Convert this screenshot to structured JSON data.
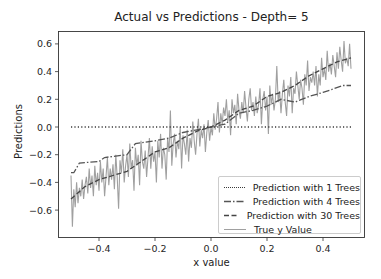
{
  "chart_data": {
    "type": "line",
    "title": "Actual vs Predictions - Depth= 5",
    "xlabel": "x value",
    "ylabel": "Predictions",
    "xlim": [
      -0.55,
      0.55
    ],
    "ylim": [
      -0.78,
      0.68
    ],
    "x_ticks": [
      -0.4,
      -0.2,
      0.0,
      0.2,
      0.4
    ],
    "x_tick_labels": [
      "−0.4",
      "−0.2",
      "0.0",
      "0.2",
      "0.4"
    ],
    "y_ticks": [
      0.6,
      0.4,
      0.2,
      0.0,
      -0.2,
      -0.4,
      -0.6
    ],
    "y_tick_labels": [
      "0.6",
      "0.4",
      "0.2",
      "0.0",
      "−0.2",
      "−0.4",
      "−0.6"
    ],
    "grid": false,
    "legend_position": "lower right",
    "series": [
      {
        "name": "Prediction with 1 Trees",
        "style": "dotted",
        "color": "#3a3a3a",
        "x": [
          -0.5,
          0.5
        ],
        "values": [
          0.0,
          0.0
        ]
      },
      {
        "name": "Prediction with 4 Trees",
        "style": "dashdot",
        "color": "#555555",
        "x": [
          -0.5,
          -0.49,
          -0.47,
          -0.4,
          -0.38,
          -0.3,
          -0.27,
          -0.2,
          -0.15,
          -0.1,
          -0.05,
          0.0,
          0.05,
          0.1,
          0.15,
          0.2,
          0.25,
          0.3,
          0.35,
          0.4,
          0.43,
          0.47,
          0.5
        ],
        "values": [
          -0.33,
          -0.33,
          -0.26,
          -0.25,
          -0.22,
          -0.2,
          -0.12,
          -0.1,
          -0.08,
          -0.04,
          -0.02,
          0.0,
          0.02,
          0.1,
          0.12,
          0.15,
          0.2,
          0.18,
          0.22,
          0.25,
          0.27,
          0.3,
          0.3
        ]
      },
      {
        "name": "Prediction with 30 Trees",
        "style": "dashed",
        "color": "#444444",
        "x": [
          -0.5,
          -0.45,
          -0.4,
          -0.35,
          -0.3,
          -0.25,
          -0.2,
          -0.15,
          -0.1,
          -0.05,
          0.0,
          0.05,
          0.1,
          0.15,
          0.2,
          0.25,
          0.3,
          0.35,
          0.4,
          0.45,
          0.5
        ],
        "values": [
          -0.52,
          -0.43,
          -0.38,
          -0.35,
          -0.32,
          -0.25,
          -0.18,
          -0.15,
          -0.08,
          -0.03,
          0.0,
          0.05,
          0.12,
          0.15,
          0.22,
          0.25,
          0.3,
          0.37,
          0.42,
          0.47,
          0.5
        ]
      },
      {
        "name": "True y Value",
        "style": "solid",
        "color": "#a0a0a0",
        "x": [
          -0.5,
          -0.495,
          -0.49,
          -0.485,
          -0.48,
          -0.475,
          -0.47,
          -0.465,
          -0.46,
          -0.455,
          -0.45,
          -0.445,
          -0.44,
          -0.435,
          -0.43,
          -0.425,
          -0.42,
          -0.415,
          -0.41,
          -0.405,
          -0.4,
          -0.395,
          -0.39,
          -0.385,
          -0.38,
          -0.375,
          -0.37,
          -0.365,
          -0.36,
          -0.355,
          -0.35,
          -0.345,
          -0.34,
          -0.335,
          -0.33,
          -0.325,
          -0.32,
          -0.315,
          -0.31,
          -0.305,
          -0.3,
          -0.295,
          -0.29,
          -0.285,
          -0.28,
          -0.275,
          -0.27,
          -0.265,
          -0.26,
          -0.255,
          -0.25,
          -0.245,
          -0.24,
          -0.235,
          -0.23,
          -0.225,
          -0.22,
          -0.215,
          -0.21,
          -0.205,
          -0.2,
          -0.195,
          -0.19,
          -0.185,
          -0.18,
          -0.175,
          -0.17,
          -0.165,
          -0.16,
          -0.155,
          -0.15,
          -0.145,
          -0.14,
          -0.135,
          -0.13,
          -0.125,
          -0.12,
          -0.115,
          -0.11,
          -0.105,
          -0.1,
          -0.095,
          -0.09,
          -0.085,
          -0.08,
          -0.075,
          -0.07,
          -0.065,
          -0.06,
          -0.055,
          -0.05,
          -0.045,
          -0.04,
          -0.035,
          -0.03,
          -0.025,
          -0.02,
          -0.015,
          -0.01,
          -0.005,
          0.0,
          0.005,
          0.01,
          0.015,
          0.02,
          0.025,
          0.03,
          0.035,
          0.04,
          0.045,
          0.05,
          0.055,
          0.06,
          0.065,
          0.07,
          0.075,
          0.08,
          0.085,
          0.09,
          0.095,
          0.1,
          0.105,
          0.11,
          0.115,
          0.12,
          0.125,
          0.13,
          0.135,
          0.14,
          0.145,
          0.15,
          0.155,
          0.16,
          0.165,
          0.17,
          0.175,
          0.18,
          0.185,
          0.19,
          0.195,
          0.2,
          0.205,
          0.21,
          0.215,
          0.22,
          0.225,
          0.23,
          0.235,
          0.24,
          0.245,
          0.25,
          0.255,
          0.26,
          0.265,
          0.27,
          0.275,
          0.28,
          0.285,
          0.29,
          0.295,
          0.3,
          0.305,
          0.31,
          0.315,
          0.32,
          0.325,
          0.33,
          0.335,
          0.34,
          0.345,
          0.35,
          0.355,
          0.36,
          0.365,
          0.37,
          0.375,
          0.38,
          0.385,
          0.39,
          0.395,
          0.4,
          0.405,
          0.41,
          0.415,
          0.42,
          0.425,
          0.43,
          0.435,
          0.44,
          0.445,
          0.45,
          0.455,
          0.46,
          0.465,
          0.47,
          0.475,
          0.48,
          0.485,
          0.49,
          0.495,
          0.5
        ],
        "values": [
          -0.35,
          -0.72,
          -0.45,
          -0.58,
          -0.4,
          -0.55,
          -0.44,
          -0.5,
          -0.38,
          -0.52,
          -0.42,
          -0.36,
          -0.48,
          -0.3,
          -0.44,
          -0.35,
          -0.5,
          -0.28,
          -0.42,
          -0.33,
          -0.46,
          -0.25,
          -0.4,
          -0.3,
          -0.5,
          -0.36,
          -0.22,
          -0.42,
          -0.3,
          -0.38,
          -0.27,
          -0.45,
          -0.2,
          -0.36,
          -0.59,
          -0.24,
          -0.33,
          -0.16,
          -0.4,
          -0.28,
          -0.2,
          -0.36,
          -0.12,
          -0.3,
          -0.24,
          -0.46,
          -0.15,
          -0.28,
          -0.2,
          -0.42,
          -0.1,
          -0.25,
          -0.3,
          -0.17,
          -0.36,
          -0.22,
          -0.08,
          -0.3,
          -0.14,
          -0.25,
          -0.18,
          -0.4,
          -0.1,
          -0.22,
          -0.05,
          -0.3,
          -0.15,
          -0.2,
          -0.38,
          -0.08,
          -0.18,
          0.12,
          -0.28,
          -0.12,
          -0.05,
          -0.22,
          -0.1,
          -0.16,
          0.0,
          -0.3,
          -0.06,
          -0.12,
          -0.2,
          -0.02,
          -0.25,
          -0.08,
          -0.15,
          0.04,
          -0.1,
          -0.2,
          -0.05,
          0.06,
          -0.14,
          -0.02,
          -0.08,
          0.02,
          -0.18,
          -0.04,
          0.05,
          -0.1,
          0.0,
          -0.06,
          0.1,
          -0.02,
          0.06,
          0.18,
          -0.04,
          0.1,
          0.02,
          0.14,
          0.08,
          0.2,
          0.04,
          0.12,
          -0.06,
          0.2,
          0.1,
          0.16,
          0.02,
          0.24,
          0.12,
          0.06,
          0.18,
          0.1,
          0.26,
          0.14,
          0.04,
          0.2,
          0.28,
          0.12,
          0.18,
          0.08,
          0.22,
          0.1,
          0.16,
          0.28,
          0.02,
          0.2,
          0.26,
          0.12,
          0.22,
          -0.05,
          0.3,
          0.16,
          0.24,
          0.12,
          0.2,
          0.44,
          0.18,
          0.26,
          0.1,
          0.24,
          0.34,
          0.18,
          0.08,
          0.3,
          0.22,
          0.36,
          0.1,
          0.28,
          0.24,
          0.4,
          0.3,
          0.2,
          0.34,
          0.28,
          0.16,
          0.38,
          0.3,
          0.48,
          0.26,
          0.36,
          0.32,
          0.4,
          0.3,
          0.44,
          0.22,
          0.38,
          0.3,
          0.5,
          0.36,
          0.42,
          0.34,
          0.55,
          0.4,
          0.46,
          0.38,
          0.52,
          0.44,
          0.36,
          0.54,
          0.42,
          0.58,
          0.48,
          0.4,
          0.62,
          0.46,
          0.5,
          0.44,
          0.6,
          0.42
        ]
      }
    ]
  },
  "legend": {
    "items": [
      {
        "label": "Prediction with 1 Trees"
      },
      {
        "label": "Prediction with 4 Trees"
      },
      {
        "label": "Prediction with 30 Trees"
      },
      {
        "label": "True y Value"
      }
    ]
  }
}
